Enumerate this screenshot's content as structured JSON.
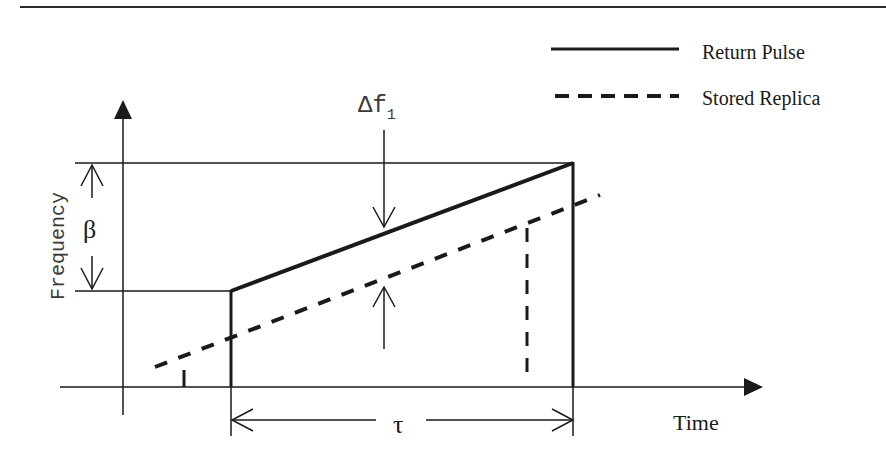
{
  "figure": {
    "type": "chirp-pulse-frequency-vs-time",
    "legend": {
      "items": [
        {
          "label": "Return Pulse",
          "style": "solid"
        },
        {
          "label": "Stored Replica",
          "style": "dashed"
        }
      ]
    },
    "axes": {
      "x_label": "Time",
      "y_label": "Frequency"
    },
    "annotations": {
      "bandwidth_symbol": "β",
      "pulse_width_symbol": "τ",
      "freq_offset_symbol": "Δf",
      "freq_offset_subscript": "1"
    },
    "colors": {
      "ink": "#1a1a1a",
      "background": "#ffffff"
    }
  }
}
